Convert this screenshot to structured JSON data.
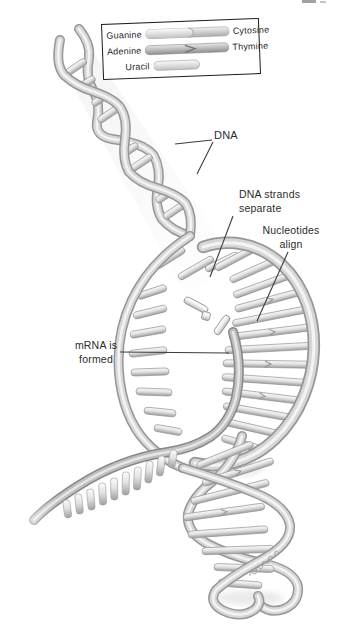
{
  "legend": {
    "rows": [
      {
        "left": "Guanine",
        "right": "Cytosine",
        "icon": "guanine-cytosine-pair-rod"
      },
      {
        "left": "Adenine",
        "right": "Thymine",
        "icon": "adenine-thymine-pair-rod"
      },
      {
        "left": "Uracil",
        "right": "",
        "icon": "uracil-rod"
      }
    ]
  },
  "annotations": {
    "dna_label": "DNA",
    "strands_separate": {
      "line1": "DNA strands",
      "line2": "separate"
    },
    "nucleotides_align": {
      "line1": "Nucleotides",
      "line2": "align"
    },
    "mrna_formed": {
      "line1": "mRNA is",
      "line2": "formed"
    }
  },
  "colors": {
    "background": "#ffffff",
    "ink": "#2b2b2b",
    "leader_line": "#3c3c3c",
    "tube_light": "#f3f3f3",
    "tube_mid": "#d6d6d6",
    "tube_edge": "#969696"
  }
}
